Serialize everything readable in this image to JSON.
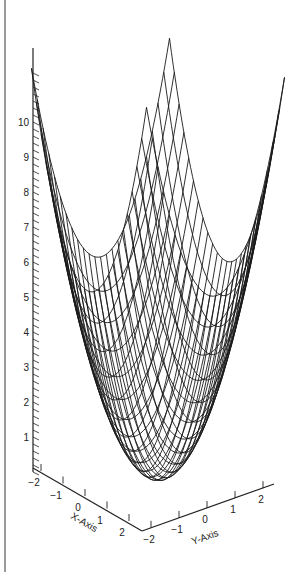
{
  "chart_data": {
    "type": "surface3d",
    "style": "wireframe",
    "function": "z = x^2 + y^2",
    "x_range": [
      -2,
      2
    ],
    "y_range": [
      -2,
      2
    ],
    "z_range": [
      0,
      8
    ],
    "grid_lines_per_axis": 25,
    "xlabel": "X-Axis",
    "ylabel": "Y-Axis",
    "zlabel": "",
    "x_ticks": [
      "-2",
      "-1",
      "0",
      "1",
      "2"
    ],
    "y_ticks": [
      "-2",
      "-1",
      "0",
      "1",
      "2"
    ],
    "z_ticks": [
      "1",
      "2",
      "3",
      "4",
      "5",
      "6",
      "7",
      "8",
      "9",
      "10"
    ],
    "z_axis_max_extent": 11.5,
    "line_color": "#1a1a1a",
    "background": "#ffffff",
    "title": ""
  },
  "colors": {
    "frame_line": "#9a9a9a",
    "axis": "#222222",
    "mesh": "#1a1a1a"
  }
}
